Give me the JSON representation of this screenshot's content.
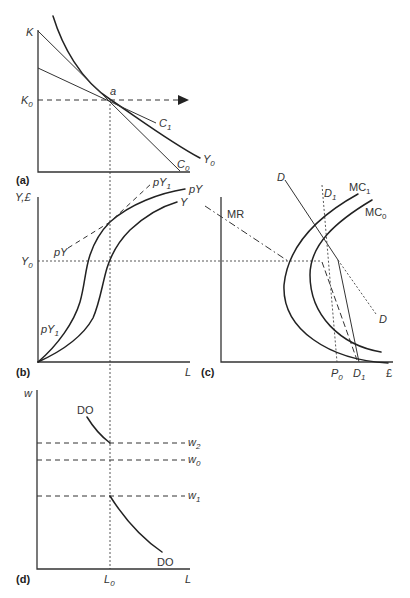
{
  "figure": {
    "shared": {
      "l0_guide": "M110,100 L110,569",
      "y0_guide": "M38,261 L322,261"
    },
    "panel_a": {
      "tag": "(a)",
      "axis": "M38,30 L38,172 L190,172",
      "labels": {
        "y_axis": {
          "text": "K"
        },
        "k0": {
          "text": "K",
          "sub": "0"
        },
        "point": {
          "text": "a"
        },
        "c1": {
          "text": "C",
          "sub": "1"
        },
        "c0": {
          "text": "C",
          "sub": "0"
        },
        "y0": {
          "text": "Y",
          "sub": "0"
        }
      },
      "curves": {
        "isoquant_y0": "M53,16 C62,45 80,80 111,100 C138,118 170,142 200,158",
        "isocost_c1": "M38,68 L156,123",
        "isocost_c0": "M38,31 L180,171",
        "k0_guide": "M38,100 L179,100",
        "arrow_head": "178,95 189,100 178,105"
      }
    },
    "panel_b": {
      "tag": "(b)",
      "axis": "M38,197 L38,362 L190,362",
      "labels": {
        "y_axis": {
          "text": "Y,£"
        },
        "y0": {
          "text": "Y",
          "sub": "0"
        },
        "x_axis": {
          "text": "L"
        },
        "py_left": {
          "text": "pY"
        },
        "py1_top": {
          "text": "pY",
          "sub": "1"
        },
        "py_right": {
          "text": "pY"
        },
        "y_right": {
          "text": "Y"
        },
        "py1_low": {
          "text": "pY",
          "sub": "1"
        }
      },
      "curves": {
        "py_curve": "M38,362 C58,345 74,322 80,302 C85,284 85,270 90,255 C95,240 102,230 110,222 C130,204 160,193 185,189",
        "y_curve": "M38,362 C60,352 82,338 93,318 C100,302 102,285 107,268 C112,252 120,240 130,230 C145,216 160,207 177,202",
        "py1_line": "M68,248 L110,222 L152,183"
      }
    },
    "panel_c": {
      "tag": "(c)",
      "axis": "M221,197 L221,362 L393,362",
      "labels": {
        "mr": {
          "text": "MR"
        },
        "d_top": {
          "text": "D"
        },
        "d1_top": {
          "text": "D",
          "sub": "1"
        },
        "mc1": {
          "text": "MC",
          "sub": "1"
        },
        "mc0": {
          "text": "MC",
          "sub": "0"
        },
        "d_right": {
          "text": "D"
        },
        "p0": {
          "text": "P",
          "sub": "0"
        },
        "d1_bottom": {
          "text": "D",
          "sub": "1"
        },
        "x_axis": {
          "text": "£"
        }
      },
      "curves": {
        "mr_line": "M205,206 L288,261",
        "mr_extension": "M322,262 L357,360",
        "demand_kinked": "M285,180 L338,260 L359,362",
        "demand_dotted": "M338,260 L376,314",
        "d1_dotted": "M322,185 L337,362",
        "mc1_curve": "M358,194 C320,215 288,245 284,285 C282,330 330,360 388,363",
        "mc0_curve": "M372,200 C335,222 310,245 310,275 C310,315 340,345 381,352"
      }
    },
    "panel_d": {
      "tag": "(d)",
      "axis": "M37,390 L37,569 L190,569",
      "labels": {
        "y_axis": {
          "text": "w"
        },
        "do_upper": {
          "text": "DO"
        },
        "w2": {
          "text": "w",
          "sub": "2"
        },
        "w0": {
          "text": "w",
          "sub": "0"
        },
        "w1": {
          "text": "w",
          "sub": "1"
        },
        "do_lower": {
          "text": "DO"
        },
        "l0": {
          "text": "L",
          "sub": "0"
        },
        "x_axis": {
          "text": "L"
        }
      },
      "curves": {
        "do_upper_curve": "M87,417 C95,430 102,437 110,443",
        "do_lower_curve": "M110,496 C122,515 140,537 162,552",
        "w2_line": "M37,443 L185,443",
        "w0_line": "M37,460 L185,460",
        "w1_line": "M37,496 L185,496"
      }
    }
  }
}
